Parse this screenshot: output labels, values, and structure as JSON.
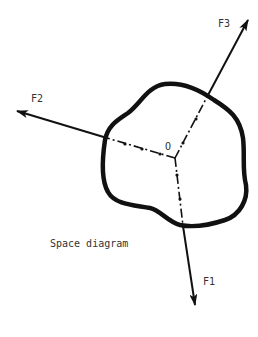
{
  "diagram": {
    "caption": "Space diagram",
    "center_label": "O",
    "forces": [
      {
        "id": "F1",
        "label": "F1"
      },
      {
        "id": "F2",
        "label": "F2"
      },
      {
        "id": "F3",
        "label": "F3"
      }
    ],
    "colors": {
      "stroke": "#111111",
      "text": "#333333",
      "background": "#ffffff"
    }
  }
}
